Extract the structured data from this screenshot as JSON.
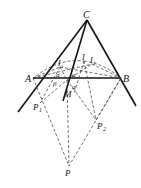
{
  "diagram": {
    "type": "geometry",
    "points": {
      "C": {
        "label": "C",
        "x": 87,
        "y": 20
      },
      "A": {
        "label": "A",
        "x": 33,
        "y": 78
      },
      "B": {
        "label": "B",
        "x": 121,
        "y": 78
      },
      "M": {
        "label": "M",
        "x": 67,
        "y": 80
      },
      "I": {
        "label": "I",
        "x": 84,
        "y": 61
      },
      "I1": {
        "label": "I",
        "sub": "1",
        "x": 60,
        "y": 67
      },
      "I2": {
        "label": "I",
        "sub": "2",
        "x": 92,
        "y": 64
      },
      "P1": {
        "label": "P",
        "sub": "1",
        "x": 40,
        "y": 103
      },
      "P2": {
        "label": "P",
        "sub": "2",
        "x": 96,
        "y": 120
      },
      "P": {
        "label": "P",
        "x": 69,
        "y": 166
      }
    },
    "angles": [
      {
        "label": "α",
        "x": 59,
        "y": 76
      },
      {
        "label": "β",
        "x": 56,
        "y": 84
      },
      {
        "label": "α",
        "x": 75,
        "y": 76
      },
      {
        "label": "α",
        "x": 75,
        "y": 87
      }
    ],
    "solid_lines": [
      [
        "C",
        "A"
      ],
      [
        "C",
        "B"
      ],
      [
        "A",
        "B"
      ],
      [
        "C",
        "M"
      ]
    ],
    "dashed_lines": [
      [
        "A",
        "P"
      ],
      [
        "B",
        "P"
      ],
      [
        "M",
        "P"
      ],
      [
        "A",
        "I1"
      ],
      [
        "I1",
        "M"
      ],
      [
        "M",
        "I2"
      ],
      [
        "I2",
        "B"
      ],
      [
        "A",
        "I2"
      ],
      [
        "I1",
        "B"
      ],
      [
        "A",
        "P1"
      ],
      [
        "P1",
        "M"
      ],
      [
        "M",
        "P2"
      ],
      [
        "P2",
        "B"
      ],
      [
        "I",
        "P2"
      ],
      [
        "I1",
        "P1"
      ]
    ]
  }
}
